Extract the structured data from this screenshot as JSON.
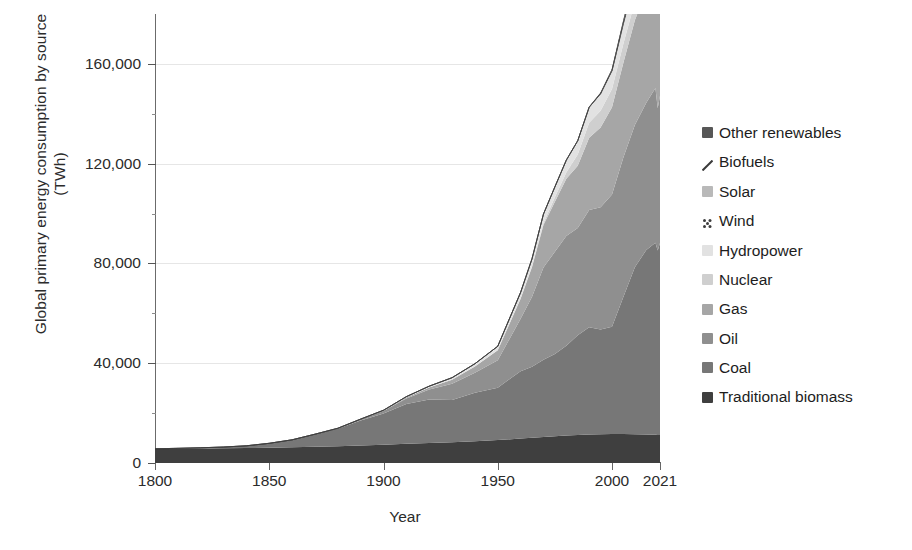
{
  "axes": {
    "y_title_line1": "Global primary energy consumption by source",
    "y_title_line2": "(TWh)",
    "x_title": "Year",
    "y_ticks": [
      "0",
      "40,000",
      "80,000",
      "120,000",
      "160,000"
    ],
    "x_ticks": [
      "1800",
      "1850",
      "1900",
      "1950",
      "2000",
      "2021"
    ]
  },
  "legend": {
    "items": [
      {
        "label": "Other renewables",
        "color": "#575757",
        "pattern": "solid"
      },
      {
        "label": "Biofuels",
        "color": "#3a3a3a",
        "pattern": "slash"
      },
      {
        "label": "Solar",
        "color": "#b9b9b9",
        "pattern": "solid"
      },
      {
        "label": "Wind",
        "color": "#4a4a4a",
        "pattern": "dots"
      },
      {
        "label": "Hydropower",
        "color": "#e2e2e2",
        "pattern": "solid"
      },
      {
        "label": "Nuclear",
        "color": "#cfcfcf",
        "pattern": "solid"
      },
      {
        "label": "Gas",
        "color": "#a6a6a6",
        "pattern": "solid"
      },
      {
        "label": "Oil",
        "color": "#8f8f8f",
        "pattern": "solid"
      },
      {
        "label": "Coal",
        "color": "#777777",
        "pattern": "solid"
      },
      {
        "label": "Traditional biomass",
        "color": "#3f3f3f",
        "pattern": "solid"
      }
    ]
  },
  "chart_data": {
    "type": "area",
    "stacked": true,
    "title": "",
    "xlabel": "Year",
    "ylabel": "Global primary energy consumption by source (TWh)",
    "xlim": [
      1800,
      2021
    ],
    "ylim": [
      0,
      180000
    ],
    "grid": true,
    "legend_position": "right",
    "x": [
      1800,
      1810,
      1820,
      1830,
      1840,
      1850,
      1860,
      1870,
      1880,
      1890,
      1900,
      1910,
      1920,
      1930,
      1940,
      1950,
      1960,
      1965,
      1970,
      1975,
      1980,
      1985,
      1990,
      1995,
      2000,
      2005,
      2010,
      2015,
      2019,
      2020,
      2021
    ],
    "series": [
      {
        "name": "Traditional biomass",
        "color": "#3f3f3f",
        "values": [
          5600,
          5700,
          5800,
          5900,
          6000,
          6100,
          6300,
          6500,
          6700,
          7000,
          7300,
          7700,
          8000,
          8300,
          8700,
          9200,
          9800,
          10100,
          10400,
          10700,
          11000,
          11200,
          11400,
          11500,
          11600,
          11600,
          11500,
          11400,
          11300,
          11200,
          11200
        ]
      },
      {
        "name": "Coal",
        "color": "#777777",
        "values": [
          98,
          180,
          300,
          500,
          900,
          1800,
          3000,
          5000,
          7000,
          10000,
          12500,
          16000,
          17500,
          17000,
          19500,
          21000,
          27000,
          28500,
          31000,
          33000,
          36000,
          40000,
          43000,
          42000,
          43000,
          55000,
          67000,
          74000,
          77000,
          74000,
          77000
        ]
      },
      {
        "name": "Oil",
        "color": "#8f8f8f",
        "values": [
          0,
          0,
          0,
          0,
          0,
          0,
          0,
          50,
          200,
          500,
          1000,
          2200,
          4000,
          6500,
          8000,
          11000,
          21000,
          28000,
          37000,
          41000,
          44000,
          43000,
          47000,
          49000,
          53000,
          56000,
          57000,
          59000,
          62000,
          57000,
          59000
        ]
      },
      {
        "name": "Gas",
        "color": "#a6a6a6",
        "values": [
          0,
          0,
          0,
          0,
          0,
          0,
          0,
          0,
          0,
          50,
          200,
          400,
          800,
          1600,
          2500,
          4000,
          8000,
          12000,
          17000,
          20000,
          23000,
          25000,
          29000,
          32000,
          35000,
          38000,
          42000,
          45000,
          49000,
          48000,
          50000
        ]
      },
      {
        "name": "Nuclear",
        "color": "#cfcfcf",
        "values": [
          0,
          0,
          0,
          0,
          0,
          0,
          0,
          0,
          0,
          0,
          0,
          0,
          0,
          0,
          0,
          0,
          100,
          300,
          800,
          1800,
          2500,
          4500,
          6000,
          6700,
          7300,
          7600,
          7400,
          6900,
          7300,
          7000,
          7000
        ]
      },
      {
        "name": "Hydropower",
        "color": "#e2e2e2",
        "values": [
          0,
          0,
          0,
          0,
          0,
          0,
          0,
          0,
          20,
          50,
          150,
          300,
          500,
          800,
          1100,
          1600,
          2500,
          3000,
          3600,
          4200,
          4900,
          5500,
          6200,
          6800,
          7300,
          7900,
          8800,
          9600,
          10300,
          10400,
          10400
        ]
      },
      {
        "name": "Wind",
        "color": "#4a4a4a",
        "values": [
          0,
          0,
          0,
          0,
          0,
          0,
          0,
          0,
          0,
          0,
          0,
          0,
          0,
          0,
          0,
          0,
          0,
          0,
          0,
          0,
          0,
          10,
          30,
          80,
          200,
          500,
          900,
          2000,
          3600,
          4000,
          4400
        ]
      },
      {
        "name": "Solar",
        "color": "#b9b9b9",
        "values": [
          0,
          0,
          0,
          0,
          0,
          0,
          0,
          0,
          0,
          0,
          0,
          0,
          0,
          0,
          0,
          0,
          0,
          0,
          0,
          0,
          0,
          0,
          0,
          5,
          10,
          30,
          100,
          600,
          1800,
          2200,
          2800
        ]
      },
      {
        "name": "Biofuels",
        "color": "#3a3a3a",
        "values": [
          0,
          0,
          0,
          0,
          0,
          0,
          0,
          0,
          0,
          0,
          0,
          0,
          0,
          0,
          0,
          0,
          0,
          0,
          0,
          0,
          20,
          50,
          100,
          200,
          300,
          600,
          1100,
          1300,
          1400,
          1300,
          1400
        ]
      },
      {
        "name": "Other renewables",
        "color": "#575757",
        "values": [
          0,
          0,
          0,
          0,
          0,
          0,
          0,
          0,
          0,
          0,
          0,
          0,
          0,
          0,
          0,
          0,
          0,
          0,
          0,
          0,
          30,
          60,
          120,
          200,
          300,
          450,
          700,
          1000,
          1500,
          1600,
          1700
        ]
      }
    ]
  }
}
